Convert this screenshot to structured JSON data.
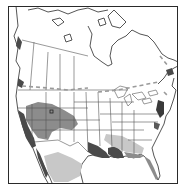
{
  "map": {
    "type": "species-range-map",
    "region": "North America",
    "style": "grayscale scanned outline map",
    "frame": {
      "x": 8,
      "y": 6,
      "width": 170,
      "height": 178
    },
    "colors": {
      "background": "#ffffff",
      "outline": "#2a2a2a",
      "border_lines": "#555555",
      "range_dark": "#4a4a4a",
      "range_medium": "#8c8c8c",
      "range_light": "#c8c8c8",
      "dashed_border": "#9a9a9a"
    },
    "legend": [],
    "marker": {
      "shape": "square",
      "location": "Utah"
    },
    "range_areas": [
      {
        "name": "Southwest interior (NV/UT/AZ/NM/CO)",
        "shade": "medium"
      },
      {
        "name": "California coast",
        "shade": "dark"
      },
      {
        "name": "Baja California",
        "shade": "dark"
      },
      {
        "name": "Northern Mexico interior",
        "shade": "light"
      },
      {
        "name": "Texas Gulf Coast",
        "shade": "dark"
      },
      {
        "name": "Louisiana / Mississippi coast",
        "shade": "dark"
      },
      {
        "name": "Florida",
        "shade": "medium"
      },
      {
        "name": "Southeastern coastal plain",
        "shade": "light"
      },
      {
        "name": "Mid-Atlantic coast",
        "shade": "dark"
      },
      {
        "name": "Pacific Northwest coast",
        "shade": "dark"
      }
    ]
  }
}
